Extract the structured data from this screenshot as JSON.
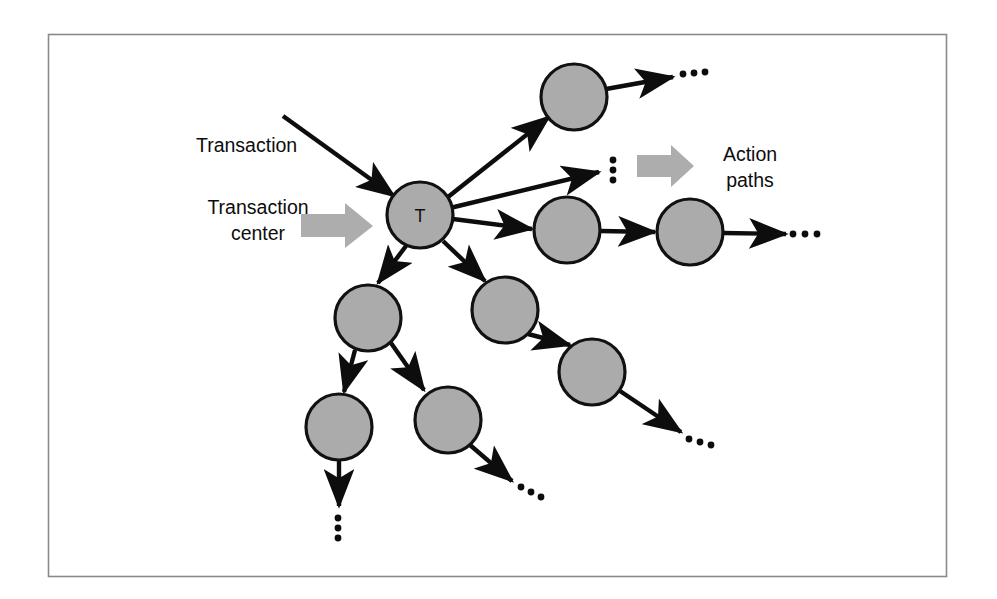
{
  "figure": {
    "kind": "structure-chart-transaction-center",
    "background_color": "#ffffff",
    "border_color": "#8a8a8a",
    "node_fill": "#ababab",
    "node_stroke": "#111111",
    "edge_color": "#0d0d0d",
    "callout_arrow_color": "#adadad",
    "labels": {
      "transaction": "Transaction",
      "transaction_center_line1": "Transaction",
      "transaction_center_line2": "center",
      "action_paths_line1": "Action",
      "action_paths_line2": "paths",
      "center_node_letter": "T"
    },
    "ellipses": {
      "horizontal": "…",
      "vertical": "⋮"
    },
    "nodes": [
      {
        "id": "T",
        "label": "T",
        "cx": 420,
        "cy": 215,
        "r": 33
      },
      {
        "id": "n1",
        "label": "",
        "cx": 574,
        "cy": 97,
        "r": 33
      },
      {
        "id": "n2",
        "label": "",
        "cx": 567,
        "cy": 230,
        "r": 33
      },
      {
        "id": "n3",
        "label": "",
        "cx": 690,
        "cy": 232,
        "r": 33
      },
      {
        "id": "n4",
        "label": "",
        "cx": 505,
        "cy": 310,
        "r": 33
      },
      {
        "id": "n5",
        "label": "",
        "cx": 592,
        "cy": 372,
        "r": 33
      },
      {
        "id": "n6",
        "label": "",
        "cx": 368,
        "cy": 318,
        "r": 33
      },
      {
        "id": "n7",
        "label": "",
        "cx": 339,
        "cy": 427,
        "r": 33
      },
      {
        "id": "n8",
        "label": "",
        "cx": 448,
        "cy": 420,
        "r": 33
      }
    ],
    "edges": [
      {
        "from": "input-transaction",
        "to": "T",
        "x1": 283,
        "y1": 116,
        "x2": 394,
        "y2": 196
      },
      {
        "from": "T",
        "to": "n1",
        "x1": 448,
        "y1": 197,
        "x2": 549,
        "y2": 117
      },
      {
        "from": "n1",
        "to": "dots-a",
        "x1": 606,
        "y1": 89,
        "x2": 673,
        "y2": 77
      },
      {
        "from": "T",
        "to": "dots-v",
        "x1": 450,
        "y1": 208,
        "x2": 601,
        "y2": 172
      },
      {
        "from": "T",
        "to": "n2",
        "x1": 453,
        "y1": 219,
        "x2": 532,
        "y2": 229
      },
      {
        "from": "n2",
        "to": "n3",
        "x1": 600,
        "y1": 231,
        "x2": 655,
        "y2": 232
      },
      {
        "from": "n3",
        "to": "dots-b",
        "x1": 723,
        "y1": 233,
        "x2": 786,
        "y2": 234
      },
      {
        "from": "T",
        "to": "n6",
        "x1": 406,
        "y1": 246,
        "x2": 378,
        "y2": 283
      },
      {
        "from": "T",
        "to": "n4",
        "x1": 443,
        "y1": 241,
        "x2": 485,
        "y2": 281
      },
      {
        "from": "n4",
        "to": "n5",
        "x1": 528,
        "y1": 334,
        "x2": 570,
        "y2": 345
      },
      {
        "from": "n5",
        "to": "dots-c",
        "x1": 620,
        "y1": 391,
        "x2": 681,
        "y2": 432
      },
      {
        "from": "n6",
        "to": "n7",
        "x1": 355,
        "y1": 350,
        "x2": 344,
        "y2": 392
      },
      {
        "from": "n6",
        "to": "n8",
        "x1": 391,
        "y1": 343,
        "x2": 424,
        "y2": 390
      },
      {
        "from": "n7",
        "to": "dots-d",
        "x1": 339,
        "y1": 460,
        "x2": 339,
        "y2": 506
      },
      {
        "from": "n8",
        "to": "dots-e",
        "x1": 470,
        "y1": 445,
        "x2": 512,
        "y2": 481
      }
    ],
    "ellipsis_marks": [
      {
        "id": "dots-a",
        "kind": "horizontal",
        "x": 690,
        "y": 76
      },
      {
        "id": "dots-v",
        "kind": "vertical",
        "x": 613,
        "y": 168
      },
      {
        "id": "dots-b",
        "kind": "horizontal",
        "x": 803,
        "y": 234
      },
      {
        "id": "dots-c",
        "kind": "horizontal",
        "x": 696,
        "y": 443
      },
      {
        "id": "dots-d",
        "kind": "vertical",
        "x": 338,
        "y": 526
      },
      {
        "id": "dots-e",
        "kind": "horizontal",
        "x": 528,
        "y": 492
      }
    ],
    "callout_arrows": [
      {
        "id": "transaction-center-arrow",
        "x": 301,
        "y": 203,
        "width": 72,
        "height": 46
      },
      {
        "id": "action-paths-arrow",
        "x": 637,
        "y": 145,
        "width": 57,
        "height": 42
      }
    ],
    "frame": {
      "x": 48,
      "y": 34,
      "width": 899,
      "height": 543
    }
  }
}
